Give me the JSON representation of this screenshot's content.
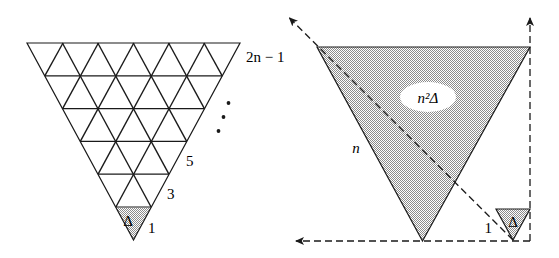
{
  "figure": {
    "background_color": "#ffffff",
    "ink_color": "#1a1a1a",
    "shade_color": "#b4b4b4",
    "left_panel": {
      "name": "subdivided-triangle-grid",
      "description": "Inverted equilateral triangle subdivided into 36 unit triangles arranged in 6 rows",
      "rows": 6,
      "row_triangle_counts": [
        11,
        9,
        7,
        5,
        3,
        1
      ],
      "row_labels": [
        {
          "text": "2n − 1",
          "row": 1
        },
        {
          "text": "5",
          "row": 4
        },
        {
          "text": "3",
          "row": 5
        },
        {
          "text": "1",
          "row": 6
        }
      ],
      "unit_cell_label": "Δ",
      "ellipsis": "⋮",
      "ellipsis_dots": 3,
      "shaded_cell": "bottom-apex unit triangle"
    },
    "right_panel": {
      "name": "scaled-triangle",
      "description": "Large inverted shaded equilateral triangle of side n with a unit triangle at lower right",
      "area_label": "n²Δ",
      "side_label": "n",
      "unit_side_label": "1",
      "unit_area_label": "Δ",
      "arrows": [
        {
          "name": "diagonal-scale-arrow",
          "direction": "up-left",
          "style": "dashed"
        },
        {
          "name": "vertical-scale-arrow",
          "direction": "up",
          "style": "dashed"
        },
        {
          "name": "horizontal-scale-arrow",
          "direction": "left",
          "style": "dashed"
        }
      ]
    }
  },
  "labels": {
    "two_n_minus_one": "2n − 1",
    "five": "5",
    "three": "3",
    "one": "1",
    "delta": "Δ",
    "n": "n",
    "n_squared_delta": "n²Δ",
    "unit_one": "1",
    "unit_delta": "Δ"
  }
}
